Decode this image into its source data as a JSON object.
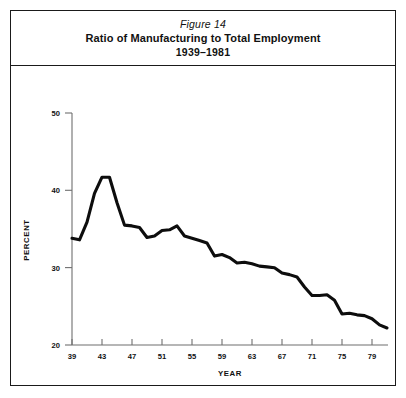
{
  "figure": {
    "number_label": "Figure 14",
    "title": "Ratio of Manufacturing to Total Employment",
    "subtitle": "1939–1981"
  },
  "axes": {
    "y_axis_name": "PERCENT",
    "x_axis_name": "YEAR",
    "y_ticks": [
      "50",
      "40",
      "30",
      "20"
    ],
    "x_ticks": [
      "39",
      "43",
      "47",
      "51",
      "55",
      "59",
      "63",
      "67",
      "71",
      "75",
      "79"
    ]
  },
  "chart_data": {
    "type": "line",
    "subtitle": "Figure 14",
    "xlabel": "YEAR",
    "ylabel": "PERCENT",
    "xlim": [
      39,
      81
    ],
    "ylim": [
      20,
      50
    ],
    "ytick_values": [
      50,
      40,
      30,
      20
    ],
    "xtick_values": [
      39,
      43,
      47,
      51,
      55,
      59,
      63,
      67,
      71,
      75,
      79
    ],
    "grid": false,
    "legend": false,
    "line_color": "#0d0d0d",
    "x": [
      1939,
      1940,
      1941,
      1942,
      1943,
      1944,
      1945,
      1946,
      1947,
      1948,
      1949,
      1950,
      1951,
      1952,
      1953,
      1954,
      1955,
      1956,
      1957,
      1958,
      1959,
      1960,
      1961,
      1962,
      1963,
      1964,
      1965,
      1966,
      1967,
      1968,
      1969,
      1970,
      1971,
      1972,
      1973,
      1974,
      1975,
      1976,
      1977,
      1978,
      1979,
      1980,
      1981
    ],
    "values": [
      33.8,
      33.6,
      35.9,
      39.6,
      41.7,
      41.7,
      38.4,
      35.5,
      35.4,
      35.2,
      33.9,
      34.1,
      34.8,
      34.9,
      35.4,
      34.1,
      33.8,
      33.5,
      33.2,
      31.5,
      31.7,
      31.3,
      30.6,
      30.7,
      30.5,
      30.2,
      30.1,
      30.0,
      29.3,
      29.1,
      28.8,
      27.5,
      26.4,
      26.4,
      26.5,
      25.8,
      24.0,
      24.1,
      23.9,
      23.8,
      23.4,
      22.6,
      22.2
    ],
    "series": [
      {
        "name": "Ratio of manufacturing to total employment",
        "values": [
          33.8,
          33.6,
          35.9,
          39.6,
          41.7,
          41.7,
          38.4,
          35.5,
          35.4,
          35.2,
          33.9,
          34.1,
          34.8,
          34.9,
          35.4,
          34.1,
          33.8,
          33.5,
          33.2,
          31.5,
          31.7,
          31.3,
          30.6,
          30.7,
          30.5,
          30.2,
          30.1,
          30.0,
          29.3,
          29.1,
          28.8,
          27.5,
          26.4,
          26.4,
          26.5,
          25.8,
          24.0,
          24.1,
          23.9,
          23.8,
          23.4,
          22.6,
          22.2
        ]
      }
    ]
  }
}
